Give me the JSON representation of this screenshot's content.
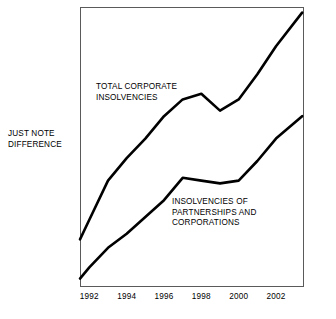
{
  "figure": {
    "side_note": "JUST NOTE\nDIFFERENCE",
    "frame_color": "#5a5a5a",
    "line_color": "#000000",
    "background": "#ffffff"
  },
  "annotations": {
    "total_label": "TOTAL CORPORATE\nINSOLVENCIES",
    "partnerships_label": "INSOLVENCIES OF\nPARTNERSHIPS AND\nCORPORATIONS"
  },
  "chart_data": {
    "type": "line",
    "title": "",
    "subtitle": "",
    "xlabel": "",
    "ylabel": "",
    "grid": false,
    "legend_position": "inline-annotations",
    "xlim": [
      1991.5,
      2003.5
    ],
    "ylim": [
      0,
      100
    ],
    "tick_labels": [
      "1992",
      "1994",
      "1996",
      "1998",
      "2000",
      "2002"
    ],
    "ticks": [
      1992,
      1994,
      1996,
      1998,
      2000,
      2002
    ],
    "x": [
      1991.5,
      1992,
      1993,
      1994,
      1995,
      1996,
      1997,
      1998,
      1999,
      2000,
      2001,
      2002,
      2003.4
    ],
    "series": [
      {
        "name": "TOTAL CORPORATE INSOLVENCIES",
        "values": [
          17,
          24,
          38,
          46,
          53,
          61,
          67,
          69,
          63,
          67,
          76,
          86,
          98
        ]
      },
      {
        "name": "INSOLVENCIES OF PARTNERSHIPS AND CORPORATIONS",
        "values": [
          3,
          7,
          14,
          19,
          25,
          31,
          39,
          38,
          37,
          38,
          45,
          53,
          61
        ]
      }
    ],
    "annotations": [
      {
        "text": "TOTAL CORPORATE INSOLVENCIES",
        "series": 0
      },
      {
        "text": "INSOLVENCIES OF PARTNERSHIPS AND CORPORATIONS",
        "series": 1
      }
    ],
    "notes": "JUST NOTE DIFFERENCE"
  }
}
